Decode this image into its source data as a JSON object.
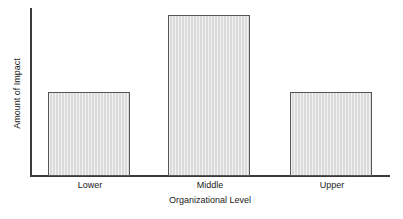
{
  "chart_data": {
    "type": "bar",
    "title": "",
    "categories": [
      "Lower",
      "Middle",
      "Upper"
    ],
    "values": [
      50,
      96,
      50
    ],
    "series": [
      {
        "name": "Amount of Impact",
        "values": [
          50,
          96,
          50
        ]
      }
    ],
    "xlabel": "Organizational Level",
    "ylabel": "Amount of Impact",
    "ylim": [
      0,
      100
    ],
    "xticklabels": [
      "Lower",
      "Middle",
      "Upper"
    ],
    "yticklabels": [],
    "grid": false,
    "legend": false,
    "legend_position": "none",
    "annotations": [],
    "bar_fill_color": "#e3e3e3",
    "bar_border_color": "#555555",
    "axis_color": "#3a3a3a"
  },
  "axes": {
    "x_title": "Organizational Level",
    "y_title": "Amount of Impact"
  },
  "bars": [
    {
      "label": "Lower",
      "value": 50
    },
    {
      "label": "Middle",
      "value": 96
    },
    {
      "label": "Upper",
      "value": 50
    }
  ]
}
